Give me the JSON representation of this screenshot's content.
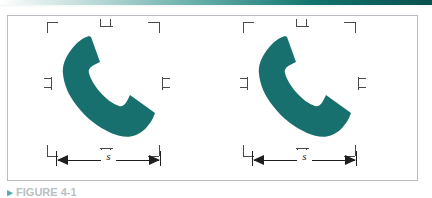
{
  "page": {
    "top_rule_color": "#0d5f5c",
    "frame_border_color": "#b9bcc0",
    "background": "#ffffff"
  },
  "figure": {
    "caption_bullet": "▸",
    "caption_text": "FIGURE 4-1",
    "frame_label": "figure-panel",
    "panels": [
      {
        "id": "panel-0",
        "icon_name": "telephone-handset-icon",
        "icon_color": "#17706e",
        "dimension": {
          "label": "s",
          "arrow_left": "◀",
          "arrow_right": "▶"
        },
        "registration_marks": [
          "corner-top-left",
          "corner-top-right",
          "corner-bottom-left",
          "corner-bottom-right",
          "tick-top-center",
          "tick-bottom-center",
          "tick-left-middle",
          "tick-right-middle"
        ]
      },
      {
        "id": "panel-1",
        "icon_name": "telephone-handset-icon",
        "icon_color": "#17706e",
        "dimension": {
          "label": "s",
          "arrow_left": "◀",
          "arrow_right": "▶"
        },
        "registration_marks": [
          "corner-top-left",
          "corner-top-right",
          "corner-bottom-left",
          "corner-bottom-right",
          "tick-top-center",
          "tick-bottom-center",
          "tick-left-middle",
          "tick-right-middle"
        ]
      }
    ]
  }
}
